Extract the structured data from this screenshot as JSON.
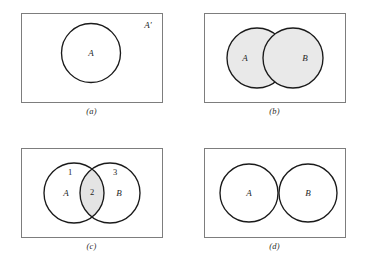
{
  "figure": {
    "background_color": "#ffffff",
    "rect_stroke_color": "#7d7d7d",
    "circle_stroke_color": "#1a1a1a",
    "shade_color": "#e9e9e9"
  },
  "panels": [
    {
      "id": "a",
      "caption": "(a)",
      "description": "Complement of A inside universal set",
      "labels": {
        "circle_a": "A",
        "complement": "A′"
      }
    },
    {
      "id": "b",
      "caption": "(b)",
      "description": "Union of A and B, both circles shaded",
      "labels": {
        "circle_a": "A",
        "circle_b": "B"
      }
    },
    {
      "id": "c",
      "caption": "(c)",
      "description": "Intersection of A and B, lens region shaded",
      "labels": {
        "circle_a": "A",
        "circle_b": "B",
        "region_1": "1",
        "region_2": "2",
        "region_3": "3"
      }
    },
    {
      "id": "d",
      "caption": "(d)",
      "description": "Disjoint sets A and B",
      "labels": {
        "circle_a": "A",
        "circle_b": "B"
      }
    }
  ]
}
